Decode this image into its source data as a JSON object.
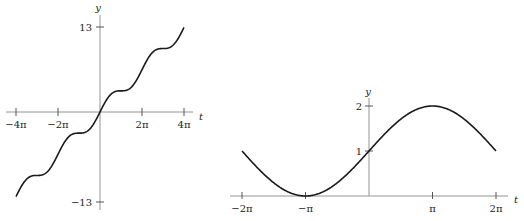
{
  "chart_data": [
    {
      "type": "line",
      "title": "",
      "function": "y = t + sin t",
      "xlabel": "t",
      "ylabel": "y",
      "x_ticks": [
        "-4π",
        "-2π",
        "2π",
        "4π"
      ],
      "x_tick_values": [
        -12.566,
        -6.283,
        6.283,
        12.566
      ],
      "y_ticks": [
        "13",
        "-13"
      ],
      "y_tick_values": [
        13,
        -13
      ],
      "xlim": [
        -12.566,
        12.566
      ],
      "ylim": [
        -13,
        13
      ],
      "grid": false,
      "x": [
        -12.566,
        -9.425,
        -6.283,
        -3.142,
        0,
        3.142,
        6.283,
        9.425,
        12.566
      ],
      "values": [
        -12.566,
        -9.425,
        -6.283,
        -3.142,
        0,
        3.142,
        6.283,
        9.425,
        12.566
      ]
    },
    {
      "type": "line",
      "title": "",
      "function": "y = 1 + sin(t/2)",
      "xlabel": "t",
      "ylabel": "y",
      "x_ticks": [
        "-2π",
        "-π",
        "π",
        "2π"
      ],
      "x_tick_values": [
        -6.283,
        -3.142,
        3.142,
        6.283
      ],
      "y_ticks": [
        "1",
        "2"
      ],
      "y_tick_values": [
        1,
        2
      ],
      "xlim": [
        -6.283,
        6.283
      ],
      "ylim": [
        0,
        2
      ],
      "grid": false,
      "x": [
        -6.283,
        -3.142,
        0,
        3.142,
        6.283
      ],
      "values": [
        1,
        0,
        1,
        2,
        1
      ]
    }
  ],
  "left": {
    "xlabel": "t",
    "ylabel": "y",
    "xticks": [
      "−4π",
      "−2π",
      "2π",
      "4π"
    ],
    "yticks": [
      "13",
      "−13"
    ]
  },
  "right": {
    "xlabel": "t",
    "ylabel": "y",
    "xticks": [
      "−2π",
      "−π",
      "π",
      "2π"
    ],
    "yticks": [
      "2",
      "1"
    ]
  }
}
